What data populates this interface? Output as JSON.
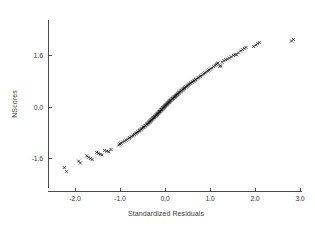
{
  "chart_data": {
    "type": "scatter",
    "title": "",
    "subtitle": "",
    "xlabel": "Standardized  Residuals",
    "ylabel": "NScores",
    "xlim": [
      -2.6,
      3.3
    ],
    "ylim": [
      -2.15,
      2.15
    ],
    "xticks": [
      -2.0,
      -1.0,
      0.0,
      1.0,
      2.0,
      3.0
    ],
    "xticklabels": [
      "-2.0",
      "-1.0",
      "0.0",
      "1.0",
      "2.0",
      "3.0"
    ],
    "yticks": [
      -1.6,
      0.0,
      1.6
    ],
    "yticklabels": [
      "-1.6",
      "0.0",
      "1.6"
    ],
    "grid": false,
    "legend": null,
    "marker": "x",
    "marker_color": "#1a1a1a",
    "marker_size": 3.0,
    "n_points": 186,
    "series": [
      {
        "name": "Normal probability plot",
        "x": [
          -2.24,
          -2.19,
          -1.92,
          -1.88,
          -1.74,
          -1.7,
          -1.66,
          -1.62,
          -1.52,
          -1.48,
          -1.44,
          -1.4,
          -1.34,
          -1.29,
          -1.25,
          -1.2,
          -1.03,
          -1.0,
          -0.97,
          -0.94,
          -0.9,
          -0.86,
          -0.83,
          -0.8,
          -0.78,
          -0.75,
          -0.72,
          -0.7,
          -0.68,
          -0.66,
          -0.64,
          -0.62,
          -0.6,
          -0.58,
          -0.56,
          -0.55,
          -0.53,
          -0.51,
          -0.5,
          -0.48,
          -0.47,
          -0.45,
          -0.44,
          -0.43,
          -0.41,
          -0.4,
          -0.39,
          -0.38,
          -0.36,
          -0.35,
          -0.34,
          -0.33,
          -0.32,
          -0.31,
          -0.3,
          -0.29,
          -0.28,
          -0.27,
          -0.26,
          -0.25,
          -0.24,
          -0.23,
          -0.22,
          -0.21,
          -0.2,
          -0.19,
          -0.18,
          -0.17,
          -0.17,
          -0.16,
          -0.15,
          -0.14,
          -0.13,
          -0.12,
          -0.12,
          -0.11,
          -0.1,
          -0.09,
          -0.08,
          -0.08,
          -0.07,
          -0.06,
          -0.05,
          -0.04,
          -0.04,
          -0.03,
          -0.02,
          -0.01,
          0.0,
          0.0,
          0.01,
          0.02,
          0.03,
          0.04,
          0.05,
          0.05,
          0.06,
          0.07,
          0.08,
          0.09,
          0.1,
          0.1,
          0.11,
          0.12,
          0.13,
          0.14,
          0.15,
          0.16,
          0.17,
          0.18,
          0.19,
          0.2,
          0.21,
          0.22,
          0.23,
          0.24,
          0.25,
          0.26,
          0.27,
          0.28,
          0.29,
          0.3,
          0.31,
          0.32,
          0.34,
          0.35,
          0.36,
          0.37,
          0.39,
          0.4,
          0.41,
          0.43,
          0.44,
          0.46,
          0.47,
          0.49,
          0.51,
          0.52,
          0.54,
          0.56,
          0.58,
          0.6,
          0.62,
          0.64,
          0.66,
          0.68,
          0.7,
          0.73,
          0.75,
          0.78,
          0.8,
          0.83,
          0.86,
          0.89,
          0.92,
          0.95,
          0.98,
          1.01,
          1.04,
          1.08,
          1.11,
          1.14,
          1.16,
          1.18,
          1.27,
          1.31,
          1.35,
          1.39,
          1.43,
          1.47,
          1.52,
          1.56,
          1.63,
          1.68,
          1.72,
          1.76,
          1.97,
          2.02,
          2.06,
          2.1,
          2.81,
          2.85,
          1.22,
          1.24,
          1.59,
          1.8
        ],
        "y": [
          -1.88,
          -2.0,
          -1.68,
          -1.74,
          -1.52,
          -1.56,
          -1.6,
          -1.63,
          -1.41,
          -1.44,
          -1.47,
          -1.49,
          -1.35,
          -1.37,
          -1.39,
          -1.32,
          -1.18,
          -1.15,
          -1.12,
          -1.09,
          -1.06,
          -1.03,
          -1.0,
          -0.97,
          -0.95,
          -0.92,
          -0.9,
          -0.87,
          -0.85,
          -0.83,
          -0.81,
          -0.79,
          -0.77,
          -0.75,
          -0.73,
          -0.71,
          -0.69,
          -0.67,
          -0.65,
          -0.63,
          -0.62,
          -0.6,
          -0.58,
          -0.57,
          -0.55,
          -0.53,
          -0.52,
          -0.5,
          -0.49,
          -0.47,
          -0.46,
          -0.44,
          -0.43,
          -0.41,
          -0.4,
          -0.39,
          -0.37,
          -0.36,
          -0.34,
          -0.33,
          -0.32,
          -0.3,
          -0.29,
          -0.28,
          -0.26,
          -0.25,
          -0.24,
          -0.23,
          -0.21,
          -0.2,
          -0.19,
          -0.18,
          -0.16,
          -0.15,
          -0.14,
          -0.13,
          -0.12,
          -0.1,
          -0.09,
          -0.08,
          -0.07,
          -0.06,
          -0.04,
          -0.03,
          -0.02,
          -0.01,
          0.0,
          0.01,
          0.02,
          0.04,
          0.05,
          0.06,
          0.07,
          0.08,
          0.09,
          0.11,
          0.12,
          0.13,
          0.14,
          0.15,
          0.16,
          0.18,
          0.19,
          0.2,
          0.21,
          0.22,
          0.24,
          0.25,
          0.26,
          0.27,
          0.28,
          0.3,
          0.31,
          0.32,
          0.33,
          0.35,
          0.36,
          0.37,
          0.39,
          0.4,
          0.41,
          0.43,
          0.44,
          0.46,
          0.47,
          0.49,
          0.5,
          0.52,
          0.53,
          0.55,
          0.57,
          0.58,
          0.6,
          0.62,
          0.63,
          0.65,
          0.67,
          0.69,
          0.71,
          0.73,
          0.75,
          0.77,
          0.79,
          0.81,
          0.83,
          0.85,
          0.87,
          0.9,
          0.92,
          0.95,
          0.97,
          1.0,
          1.03,
          1.06,
          1.09,
          1.12,
          1.15,
          1.18,
          1.21,
          1.25,
          1.29,
          1.32,
          1.35,
          1.37,
          1.39,
          1.44,
          1.47,
          1.49,
          1.52,
          1.56,
          1.6,
          1.63,
          1.68,
          1.74,
          1.78,
          1.82,
          1.88,
          1.92,
          1.97,
          2.0,
          2.05,
          2.1,
          1.26,
          1.28,
          1.62,
          1.85
        ]
      }
    ]
  },
  "axes": {
    "x_axis_name": "x-axis",
    "y_axis_name": "y-axis"
  }
}
